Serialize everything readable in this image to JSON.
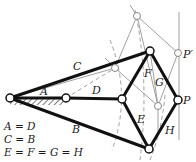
{
  "diagram": {
    "links": {
      "A": "A",
      "B": "B",
      "C": "C",
      "D": "D",
      "E": "E",
      "F": "F",
      "G": "G",
      "H": "H"
    },
    "points": {
      "P": "P",
      "P_prime": "P′"
    },
    "equations": [
      "A = D",
      "C = B",
      "E = F = G = H"
    ]
  }
}
